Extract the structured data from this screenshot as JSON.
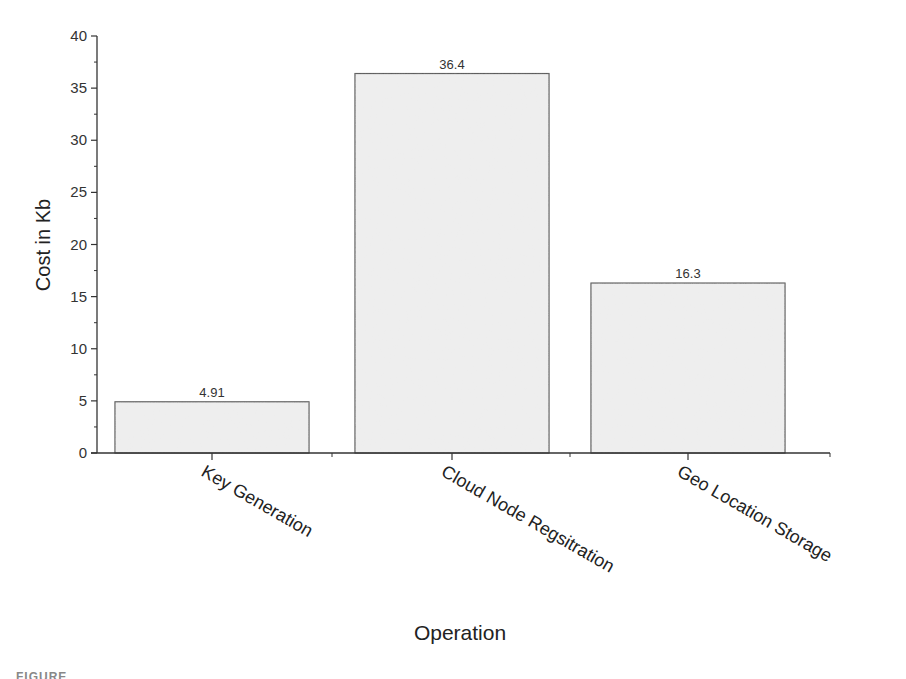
{
  "chart_data": {
    "type": "bar",
    "title": "",
    "xlabel": "Operation",
    "ylabel": "Cost in Kb",
    "categories": [
      "Key Generation",
      "Cloud Node Regsitration",
      "Geo Location Storage"
    ],
    "values": [
      4.91,
      36.4,
      16.3
    ],
    "data_labels": [
      "4.91",
      "36.4",
      "16.3"
    ],
    "ylim": [
      0,
      40
    ],
    "yticks": [
      0,
      5,
      10,
      15,
      20,
      25,
      30,
      35,
      40
    ],
    "ytick_labels": [
      "0",
      "5",
      "10",
      "15",
      "20",
      "25",
      "30",
      "35",
      "40"
    ],
    "grid": false,
    "legend": null,
    "bar_fill": "#eeeeee",
    "bar_edge": "#555555"
  },
  "caption_fragment": "FIGURE"
}
